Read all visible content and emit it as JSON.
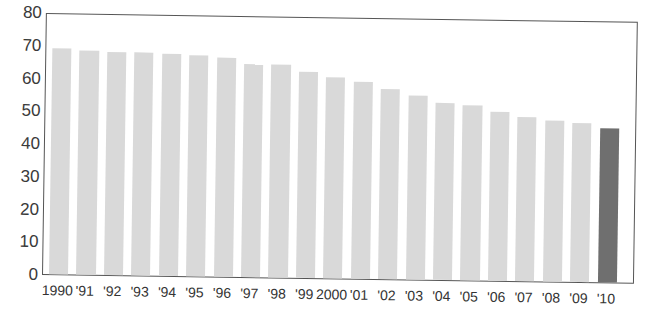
{
  "chart_data": {
    "type": "bar",
    "title": "",
    "xlabel": "",
    "ylabel": "",
    "ylim": [
      0,
      80
    ],
    "yticks": [
      0,
      10,
      20,
      30,
      40,
      50,
      60,
      70,
      80
    ],
    "grid": false,
    "legend": null,
    "categories": [
      "1990",
      "'91",
      "'92",
      "'93",
      "'94",
      "'95",
      "'96",
      "'97",
      "'98",
      "'99",
      "2000",
      "'01",
      "'02",
      "'03",
      "'04",
      "'05",
      "'06",
      "'07",
      "'08",
      "'09",
      "'10"
    ],
    "values": [
      69.5,
      69,
      68.7,
      68.7,
      68.3,
      68,
      67.3,
      65.5,
      65.5,
      63.5,
      62,
      60.5,
      58.5,
      56.5,
      54.5,
      54,
      52,
      50.5,
      49.5,
      48.8,
      47.5
    ],
    "highlight_index": 20,
    "colors": {
      "bar": "#d9d9d9",
      "highlight_bar": "#6f6f6f",
      "axis": "#555555"
    }
  }
}
